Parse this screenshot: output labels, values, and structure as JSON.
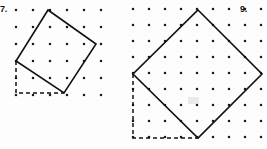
{
  "page": {
    "background_color": "#fdfdfd",
    "ink_color": "#111111",
    "dot_color": "#1a1a1a",
    "width": 267,
    "height": 149
  },
  "figures": [
    {
      "id": "figure-7",
      "number_label": "7.",
      "number_position": {
        "x": 0,
        "y": 5
      },
      "grid": {
        "origin_x": 16,
        "origin_y": 10,
        "spacing": 17,
        "cols": 6,
        "rows": 6,
        "dot_radius": 1.3
      },
      "square": {
        "name": "tilted-square",
        "vertices": [
          {
            "x": 48,
            "y": 10
          },
          {
            "x": 96,
            "y": 44
          },
          {
            "x": 64,
            "y": 93
          },
          {
            "x": 16,
            "y": 61
          }
        ],
        "stroke_width": 1.6,
        "fill": "none"
      },
      "dashed_legs": {
        "name": "right-triangle-legs",
        "corner": {
          "x": 16,
          "y": 93
        },
        "vertical_from": {
          "x": 16,
          "y": 61
        },
        "horizontal_to": {
          "x": 64,
          "y": 93
        },
        "dash_pattern": "4 3"
      }
    },
    {
      "id": "figure-9",
      "number_label": "9.",
      "number_position": {
        "x": 110,
        "y": 5
      },
      "grid": {
        "origin_x": 133,
        "origin_y": 9,
        "spacing": 16,
        "cols": 9,
        "rows": 9,
        "dot_radius": 1.3
      },
      "square": {
        "name": "tilted-square",
        "vertices": [
          {
            "x": 198,
            "y": 10
          },
          {
            "x": 262,
            "y": 74
          },
          {
            "x": 198,
            "y": 138
          },
          {
            "x": 133,
            "y": 74
          }
        ],
        "stroke_width": 1.6,
        "fill": "none"
      },
      "dashed_legs": {
        "name": "right-triangle-legs",
        "corner": {
          "x": 133,
          "y": 138
        },
        "vertical_from": {
          "x": 133,
          "y": 74
        },
        "horizontal_to": {
          "x": 198,
          "y": 138
        },
        "dash_pattern": "4 3"
      },
      "smudge": {
        "x": 188,
        "y": 97,
        "width": 11,
        "height": 7
      }
    }
  ]
}
